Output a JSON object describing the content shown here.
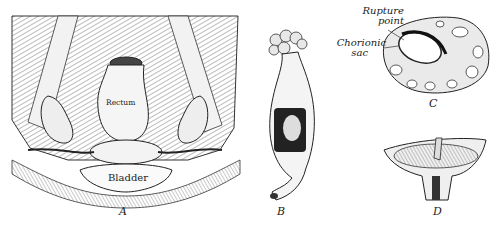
{
  "figure": {
    "panels": [
      {
        "id": "A",
        "letter": "A",
        "labels": {
          "rectum": "Rectum",
          "bladder": "Bladder"
        }
      },
      {
        "id": "B",
        "letter": "B"
      },
      {
        "id": "C",
        "letter": "C",
        "labels": {
          "rupture_line1": "Rupture",
          "rupture_line2": "point",
          "chorionic_line1": "Chorionic",
          "chorionic_line2": "sac"
        }
      },
      {
        "id": "D",
        "letter": "D"
      }
    ],
    "colors": {
      "ink": "#1a1a1a",
      "paper": "#ffffff",
      "shade": "#8a8a8a"
    }
  }
}
